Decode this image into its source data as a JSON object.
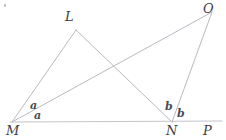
{
  "figure": {
    "canvas": {
      "width": 226,
      "height": 140
    },
    "stroke_color": "#b9b9c2",
    "baseline_color": "#c3c3ca",
    "label_color": "#3c3c46",
    "background": "#ffffff",
    "vertices": [
      {
        "name": "M",
        "label": "M",
        "x": 12,
        "y": 122
      },
      {
        "name": "L",
        "label": "L",
        "x": 76,
        "y": 30
      },
      {
        "name": "N",
        "label": "N",
        "x": 172,
        "y": 122
      },
      {
        "name": "O",
        "label": "O",
        "x": 212,
        "y": 12
      },
      {
        "name": "P",
        "label": "P",
        "x": 210,
        "y": 122
      }
    ],
    "segments": [
      {
        "name": "segment-ML",
        "from": "M",
        "to": "L"
      },
      {
        "name": "segment-LN",
        "from": "L",
        "to": "N"
      },
      {
        "name": "segment-MO",
        "from": "M",
        "to": "O"
      },
      {
        "name": "segment-NO",
        "from": "N",
        "to": "O"
      },
      {
        "name": "segment-MP",
        "from": "M",
        "to": "P"
      }
    ],
    "angle_labels": [
      {
        "name": "angle-a-upper",
        "label": "a",
        "at": "M"
      },
      {
        "name": "angle-a-lower",
        "label": "a",
        "at": "M"
      },
      {
        "name": "angle-b-left",
        "label": "b",
        "at": "N"
      },
      {
        "name": "angle-b-right",
        "label": "b",
        "at": "N"
      }
    ]
  }
}
